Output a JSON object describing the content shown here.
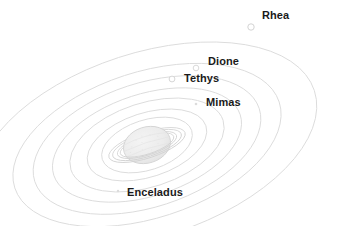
{
  "figure": {
    "kind": "orbital-diagram",
    "background_color": "#ffffff",
    "orbit_color": "#dcdcdc",
    "planet_color": "#e2e2e2",
    "label_color": "#1a1a1a",
    "marker_color": "#d8d8d8",
    "center": {
      "x": 147,
      "y": 145
    },
    "orbit_tilt_degrees": -18
  },
  "moons": [
    {
      "name": "Rhea",
      "marker": "open-circle",
      "marker_radius": 3.2,
      "marker_x": 251,
      "marker_y": 27,
      "orbit_rx": 176,
      "orbit_ry": 92,
      "label_x": 262,
      "label_y": 10
    },
    {
      "name": "Dione",
      "marker": "open-circle",
      "marker_radius": 2.8,
      "marker_x": 196,
      "marker_y": 68,
      "orbit_rx": 139,
      "orbit_ry": 73,
      "label_x": 208,
      "label_y": 56
    },
    {
      "name": "Tethys",
      "marker": "open-circle",
      "marker_radius": 2.9,
      "marker_x": 172,
      "marker_y": 79,
      "orbit_rx": 118,
      "orbit_ry": 62,
      "label_x": 184,
      "label_y": 73
    },
    {
      "name": "Mimas",
      "marker": "dot",
      "marker_radius": 1.3,
      "marker_x": 196,
      "marker_y": 104,
      "orbit_rx": 98,
      "orbit_ry": 51,
      "label_x": 206,
      "label_y": 97
    },
    {
      "name": "Enceladus",
      "marker": "dot",
      "marker_radius": 1.2,
      "marker_x": 118,
      "marker_y": 191,
      "orbit_rx": 80,
      "orbit_ry": 42,
      "label_x": 127,
      "label_y": 187
    }
  ],
  "extra_orbits": [
    {
      "rx": 62,
      "ry": 32
    },
    {
      "rx": 47,
      "ry": 25
    }
  ],
  "planet": {
    "name": "Saturn",
    "body_rx": 24,
    "body_ry": 18,
    "ring_outer_rx": 40,
    "ring_outer_ry": 13,
    "ring_inner_rx": 29,
    "ring_inner_ry": 9
  }
}
